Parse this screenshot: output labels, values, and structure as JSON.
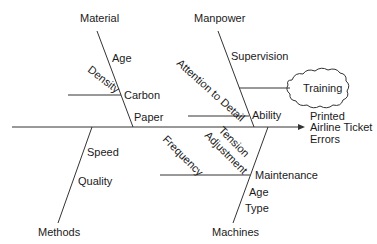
{
  "diagram": {
    "type": "fishbone",
    "effect": [
      "Printed",
      "Airline Ticket",
      "Errors"
    ],
    "categories": {
      "material": {
        "label": "Material",
        "causes": [
          "Age",
          "Density",
          "Carbon",
          "Paper"
        ]
      },
      "manpower": {
        "label": "Manpower",
        "causes": [
          "Supervision",
          "Attention to Detail",
          "Ability"
        ],
        "highlight": "Training"
      },
      "methods": {
        "label": "Methods",
        "causes": [
          "Speed",
          "Quality"
        ]
      },
      "machines": {
        "label": "Machines",
        "causes": [
          "Frequency",
          "Tension",
          "Adjustment",
          "Maintenance",
          "Age",
          "Type"
        ]
      }
    }
  },
  "colors": {
    "line": "#333333",
    "text": "#1a1a1a",
    "background": "#ffffff"
  }
}
